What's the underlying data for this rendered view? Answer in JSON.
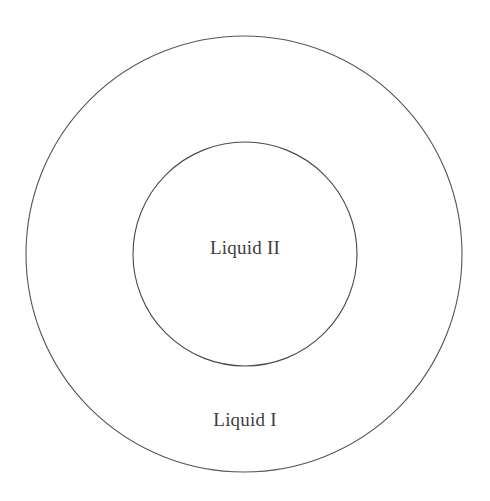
{
  "figure": {
    "type": "concentric-circles-diagram",
    "background_color": "#ffffff",
    "width": 490,
    "height": 501
  },
  "style": {
    "stroke_color": "#555555",
    "inner_stroke_color": "#4a4a4a",
    "stroke_width": 1.1,
    "fill": "none",
    "text_color": "#3d3d3d"
  },
  "shapes": {
    "outer_circle": {
      "name": "outer-circle",
      "cx": 244,
      "cy": 254,
      "r": 218
    },
    "inner_circle": {
      "name": "inner-circle",
      "cx": 245,
      "cy": 254,
      "r": 112
    }
  },
  "labels": {
    "inner_region": "Liquid II",
    "outer_region": "Liquid I"
  }
}
